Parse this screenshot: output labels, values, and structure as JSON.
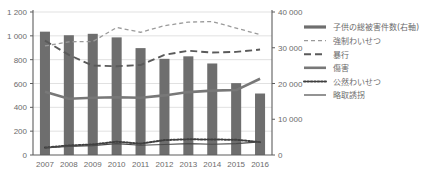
{
  "chart_data": {
    "type": "bar",
    "title": "",
    "xlabel": "",
    "ylabel": "",
    "grid": true,
    "legend_position": "right",
    "categories": [
      "2007",
      "2008",
      "2009",
      "2010",
      "2011",
      "2012",
      "2013",
      "2014",
      "2015",
      "2016"
    ],
    "left_axis": {
      "ylim": [
        0,
        1200
      ],
      "ticks": [
        0,
        200,
        400,
        600,
        800,
        1000,
        1200
      ],
      "tick_labels": [
        "0",
        "200",
        "400",
        "600",
        "800",
        "1 000",
        "1 200"
      ]
    },
    "right_axis": {
      "ylim": [
        0,
        40000
      ],
      "ticks": [
        0,
        10000,
        20000,
        30000,
        40000
      ],
      "tick_labels": [
        "0",
        "10 000",
        "20 000",
        "30 000",
        "40 000"
      ]
    },
    "series": [
      {
        "name": "子供の総被害件数(右軸)",
        "axis": "right",
        "style": "bar",
        "color": "#6e6e6e",
        "values": [
          34500,
          33500,
          33900,
          32900,
          29900,
          26900,
          27600,
          25600,
          20100,
          17200
        ]
      },
      {
        "name": "強制わいせつ",
        "axis": "left",
        "style": "dashed-short",
        "color": "#9a9a9a",
        "values": [
          915,
          950,
          952,
          1070,
          1030,
          1085,
          1115,
          1120,
          1065,
          1010
        ]
      },
      {
        "name": "暴行",
        "axis": "left",
        "style": "dashed-long",
        "color": "#5a5a5a",
        "values": [
          960,
          840,
          750,
          745,
          755,
          840,
          875,
          860,
          865,
          885
        ]
      },
      {
        "name": "傷害",
        "axis": "left",
        "style": "solid-thick",
        "color": "#787878",
        "values": [
          530,
          472,
          480,
          485,
          480,
          500,
          528,
          540,
          545,
          640
        ]
      },
      {
        "name": "公然わいせつ",
        "axis": "left",
        "style": "dotted",
        "color": "#3f3f3f",
        "values": [
          62,
          80,
          88,
          112,
          95,
          125,
          132,
          130,
          128,
          108
        ]
      },
      {
        "name": "略取誘拐",
        "axis": "left",
        "style": "solid-thin",
        "color": "#4a4a4a",
        "values": [
          60,
          72,
          78,
          95,
          82,
          88,
          95,
          90,
          95,
          110
        ]
      }
    ]
  },
  "legend": {
    "items": [
      {
        "label": "子供の総被害件数(右軸)"
      },
      {
        "label": "強制わいせつ"
      },
      {
        "label": "暴行"
      },
      {
        "label": "傷害"
      },
      {
        "label": "公然わいせつ"
      },
      {
        "label": "略取誘拐"
      }
    ]
  }
}
